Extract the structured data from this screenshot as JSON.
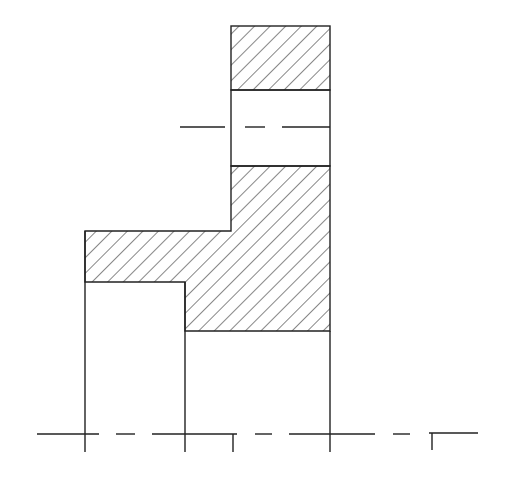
{
  "diagram": {
    "type": "mechanical-cross-section",
    "colors": {
      "line": "#222222",
      "background": "#ffffff"
    },
    "hatch": {
      "angle_deg": 45,
      "spacing_px": 11
    },
    "regions": {
      "top_hatched": {
        "x": 231,
        "y": 26,
        "w": 99,
        "h": 64
      },
      "bore_opening": {
        "x": 231,
        "y": 90,
        "w": 99,
        "h": 76
      },
      "lower_hatched_polygon": "231,166 330,166 330,331 185,331 185,282 85,282 85,231 231,231",
      "left_column": {
        "x": 85,
        "y": 282,
        "w": 100,
        "h": 152
      },
      "right_column": {
        "x": 185,
        "y": 331,
        "w": 147,
        "h": 103
      }
    },
    "centerlines": {
      "upper": {
        "y": 127,
        "segments": [
          [
            180,
            225
          ],
          [
            245,
            265
          ],
          [
            282,
            330
          ]
        ]
      },
      "lower": {
        "y": 434,
        "segments": [
          [
            37,
            99
          ],
          [
            116,
            135
          ],
          [
            152,
            237
          ],
          [
            255,
            272
          ],
          [
            289,
            375
          ],
          [
            393,
            410
          ],
          [
            429,
            478
          ]
        ]
      }
    }
  }
}
